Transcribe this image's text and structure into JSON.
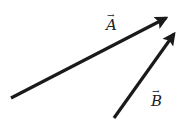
{
  "diagram": {
    "background": "#ffffff",
    "stroke_color": "#1a1a1a",
    "vectors": [
      {
        "name": "A",
        "label": "A",
        "arrow_mark": "→",
        "x1": 11,
        "y1": 98,
        "x2": 166,
        "y2": 18,
        "label_x": 106,
        "label_y": 18
      },
      {
        "name": "B",
        "label": "B",
        "arrow_mark": "→",
        "x1": 114,
        "y1": 118,
        "x2": 174,
        "y2": 34,
        "label_x": 151,
        "label_y": 94
      }
    ]
  }
}
